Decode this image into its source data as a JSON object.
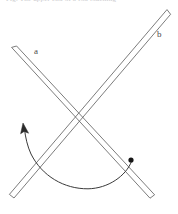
{
  "figure": {
    "caption_clipped": "Fig. The upper end of a rod touching",
    "background_color": "#ffffff",
    "stroke_color": "#5a5a5a",
    "arc_color": "#3a3a3a",
    "marker_color": "#151515",
    "labels": [
      {
        "id": "a",
        "text": "a",
        "x": 34,
        "y": 47,
        "describes": "rod running from upper-left down to lower-right"
      },
      {
        "id": "b",
        "text": "b",
        "x": 157,
        "y": 30,
        "describes": "rod running from upper-right down to lower-left"
      }
    ],
    "rods": [
      {
        "name": "rod-a",
        "label": "a",
        "thickness": 4,
        "start": {
          "x": 14,
          "y": 50
        },
        "end": {
          "x": 152,
          "y": 196
        }
      },
      {
        "name": "rod-b",
        "label": "b",
        "thickness": 4,
        "start": {
          "x": 168,
          "y": 12
        },
        "end": {
          "x": 11,
          "y": 196
        }
      }
    ],
    "crossing_point": {
      "x": 78,
      "y": 108
    },
    "pivot_marker": {
      "x": 131,
      "y": 160,
      "radius": 2.6,
      "on_rod": "a"
    },
    "motion_arc": {
      "from": {
        "x": 131,
        "y": 160
      },
      "through": {
        "x": 90,
        "y": 189
      },
      "to": {
        "x": 24,
        "y": 127
      },
      "direction": "counter-clockwise",
      "arrow_at": "to"
    }
  }
}
